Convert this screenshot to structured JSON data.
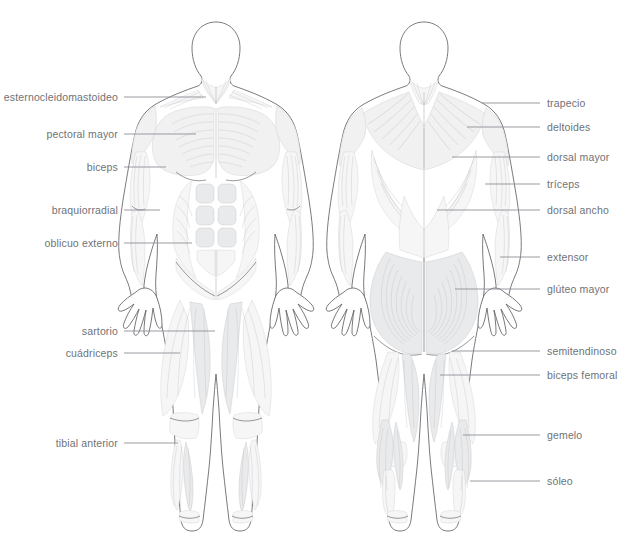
{
  "page": {
    "language": "es",
    "background_color": "#ffffff",
    "label_color": "#6f7276",
    "leader_color": "#8d9095",
    "outline_color": "#5f6266"
  },
  "figures": [
    {
      "id": "anterior",
      "name": "figura-anterior",
      "view": "anterior"
    },
    {
      "id": "posterior",
      "name": "figura-posterior",
      "view": "posterior"
    }
  ],
  "labels_left": [
    {
      "text": "esternocleidomastoideo",
      "x": 118,
      "y": 97,
      "line_from": 124,
      "line_to": 206
    },
    {
      "text": "pectoral mayor",
      "x": 118,
      "y": 134,
      "line_from": 124,
      "line_to": 196
    },
    {
      "text": "biceps",
      "x": 118,
      "y": 167,
      "line_from": 124,
      "line_to": 166
    },
    {
      "text": "braquiorradial",
      "x": 118,
      "y": 210,
      "line_from": 124,
      "line_to": 160
    },
    {
      "text": "oblicuo externo",
      "x": 118,
      "y": 243,
      "line_from": 124,
      "line_to": 192
    },
    {
      "text": "sartorio",
      "x": 118,
      "y": 331,
      "line_from": 124,
      "line_to": 215
    },
    {
      "text": "cuádriceps",
      "x": 118,
      "y": 353,
      "line_from": 124,
      "line_to": 180
    },
    {
      "text": "tibial anterior",
      "x": 118,
      "y": 443,
      "line_from": 124,
      "line_to": 178
    }
  ],
  "labels_right": [
    {
      "text": "trapecio",
      "x": 547,
      "y": 103,
      "line_from": 482,
      "line_to": 540
    },
    {
      "text": "deltoides",
      "x": 547,
      "y": 127,
      "line_from": 467,
      "line_to": 540
    },
    {
      "text": "dorsal mayor",
      "x": 547,
      "y": 157,
      "line_from": 452,
      "line_to": 540
    },
    {
      "text": "tríceps",
      "x": 547,
      "y": 184,
      "line_from": 485,
      "line_to": 540
    },
    {
      "text": "dorsal ancho",
      "x": 547,
      "y": 210,
      "line_from": 437,
      "line_to": 540
    },
    {
      "text": "extensor",
      "x": 547,
      "y": 257,
      "line_from": 500,
      "line_to": 540
    },
    {
      "text": "glúteo mayor",
      "x": 547,
      "y": 289,
      "line_from": 455,
      "line_to": 540
    },
    {
      "text": "semitendinoso",
      "x": 547,
      "y": 351,
      "line_from": 452,
      "line_to": 540
    },
    {
      "text": "biceps femoral",
      "x": 547,
      "y": 375,
      "line_from": 440,
      "line_to": 540
    },
    {
      "text": "gemelo",
      "x": 547,
      "y": 435,
      "line_from": 463,
      "line_to": 540
    },
    {
      "text": "sóleo",
      "x": 547,
      "y": 481,
      "line_from": 470,
      "line_to": 540
    }
  ]
}
